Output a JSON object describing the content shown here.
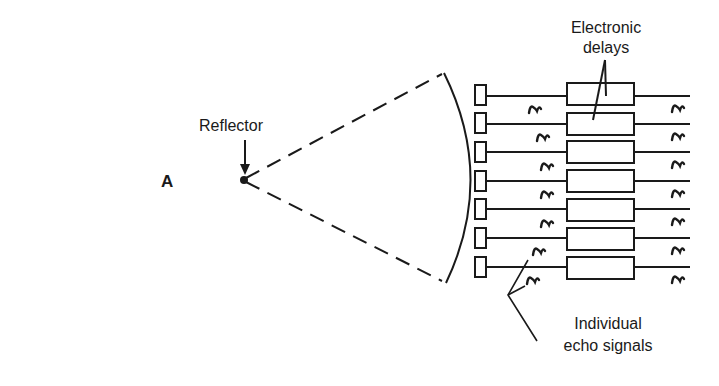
{
  "figure": {
    "panel_letter": "A",
    "labels": {
      "reflector": "Reflector",
      "delays_line1": "Electronic",
      "delays_line2": "delays",
      "echo_line1": "Individual",
      "echo_line2": "echo signals"
    },
    "array": {
      "element_count": 7,
      "row_y": [
        96,
        124,
        152,
        181,
        209,
        238,
        267
      ]
    },
    "colors": {
      "ink": "#1a1a1a",
      "background": "#ffffff"
    }
  }
}
